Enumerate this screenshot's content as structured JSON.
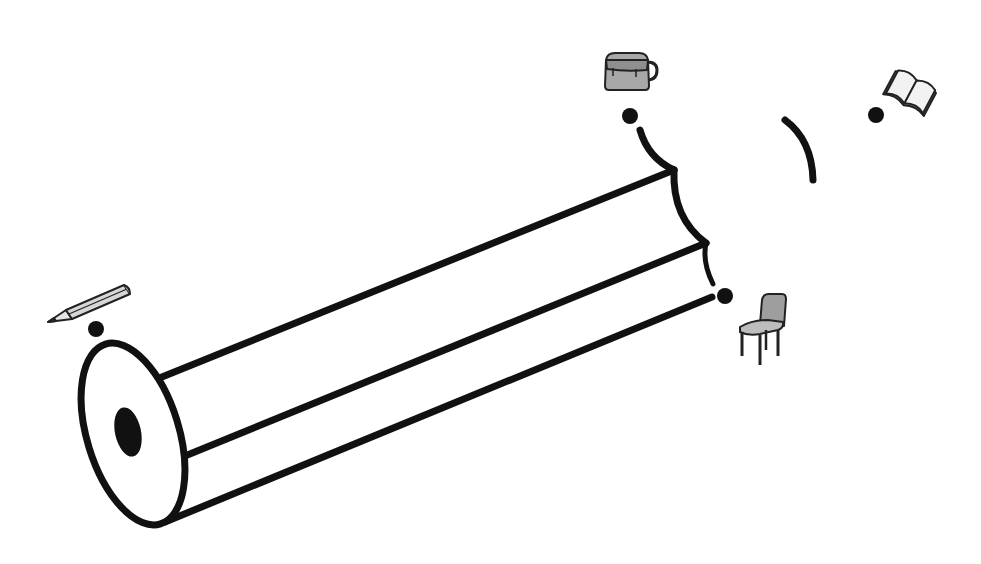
{
  "diagram": {
    "colors": {
      "stroke": "#111111",
      "background": "#ffffff",
      "icon_fill": "#a8a8a8",
      "icon_light": "#e6e6e6"
    },
    "landmarks": [
      {
        "name": "pencil",
        "icon": "pencil-icon",
        "dot": {
          "x": 96,
          "y": 329
        }
      },
      {
        "name": "bag",
        "icon": "bag-icon",
        "dot": {
          "x": 630,
          "y": 116
        }
      },
      {
        "name": "book",
        "icon": "book-icon",
        "dot": {
          "x": 876,
          "y": 115
        }
      },
      {
        "name": "chair",
        "icon": "chair-icon",
        "dot": {
          "x": 725,
          "y": 296
        }
      }
    ]
  }
}
